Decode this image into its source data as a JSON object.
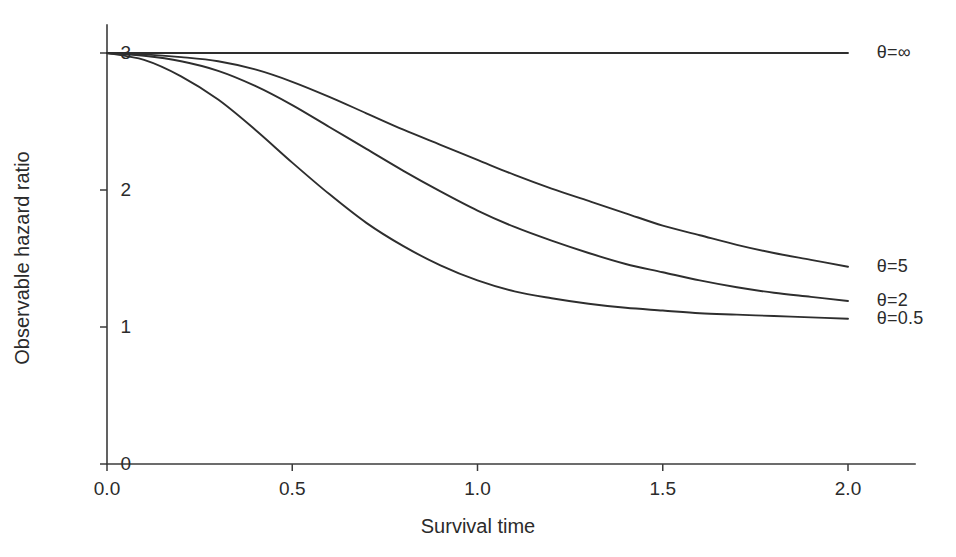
{
  "chart_data": {
    "type": "line",
    "title": "",
    "xlabel": "Survival time",
    "ylabel": "Observable hazard ratio",
    "xlim": [
      0.0,
      2.05
    ],
    "ylim": [
      0,
      3.15
    ],
    "xticks": [
      "0.0",
      "0.5",
      "1.0",
      "1.5",
      "2.0"
    ],
    "xtick_values": [
      0.0,
      0.5,
      1.0,
      1.5,
      2.0
    ],
    "yticks": [
      "0",
      "1",
      "2",
      "3"
    ],
    "ytick_values": [
      0,
      1,
      2,
      3
    ],
    "grid": false,
    "legend_position": "right-inline-annotations",
    "x": [
      0.0,
      0.1,
      0.2,
      0.3,
      0.4,
      0.5,
      0.6,
      0.7,
      0.8,
      0.9,
      1.0,
      1.1,
      1.2,
      1.3,
      1.4,
      1.5,
      1.6,
      1.7,
      1.8,
      1.9,
      2.0
    ],
    "series": [
      {
        "name": "theta-infinity",
        "label": "θ=∞",
        "theta": "∞",
        "values": [
          3.0,
          3.0,
          3.0,
          3.0,
          3.0,
          3.0,
          3.0,
          3.0,
          3.0,
          3.0,
          3.0,
          3.0,
          3.0,
          3.0,
          3.0,
          3.0,
          3.0,
          3.0,
          3.0,
          3.0,
          3.0
        ],
        "label_x": 2.04,
        "label_y": 3.0
      },
      {
        "name": "theta-5",
        "label": "θ=5",
        "theta": "5",
        "values": [
          3.0,
          2.99,
          2.97,
          2.94,
          2.88,
          2.79,
          2.68,
          2.56,
          2.44,
          2.33,
          2.22,
          2.11,
          2.01,
          1.92,
          1.83,
          1.74,
          1.67,
          1.6,
          1.54,
          1.49,
          1.44
        ],
        "label_x": 2.04,
        "label_y": 1.44
      },
      {
        "name": "theta-2",
        "label": "θ=2",
        "theta": "2",
        "values": [
          3.0,
          2.98,
          2.94,
          2.87,
          2.76,
          2.62,
          2.46,
          2.3,
          2.14,
          1.99,
          1.85,
          1.73,
          1.63,
          1.54,
          1.46,
          1.4,
          1.34,
          1.29,
          1.25,
          1.22,
          1.19
        ],
        "label_x": 2.04,
        "label_y": 1.19
      },
      {
        "name": "theta-0.5",
        "label": "θ=0.5",
        "theta": "0.5",
        "values": [
          3.0,
          2.95,
          2.83,
          2.66,
          2.44,
          2.2,
          1.97,
          1.76,
          1.59,
          1.45,
          1.34,
          1.26,
          1.21,
          1.17,
          1.14,
          1.12,
          1.1,
          1.09,
          1.08,
          1.07,
          1.06
        ],
        "label_x": 2.04,
        "label_y": 1.06
      }
    ],
    "colors": {
      "curve": "#2e2e2e",
      "axis": "#3b3b3b",
      "text": "#2b2b2b",
      "background": "#ffffff"
    }
  }
}
